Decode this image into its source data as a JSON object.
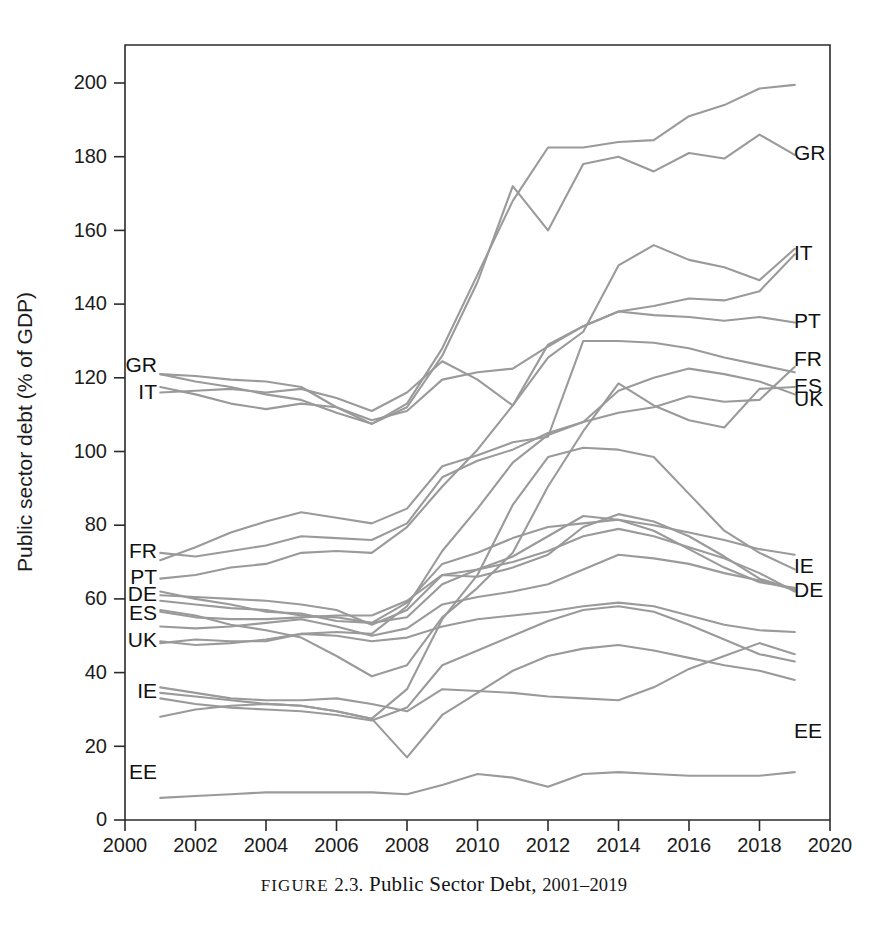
{
  "figure": {
    "caption_prefix": "FIGURE",
    "caption_number": "2.3.",
    "caption_title": "Public Sector Debt,",
    "caption_years": "2001–2019"
  },
  "axes": {
    "y_title": "Public sector debt (% of GDP)",
    "y_ticks": [
      0,
      20,
      40,
      60,
      80,
      100,
      120,
      140,
      160,
      180,
      200
    ],
    "x_ticks": [
      2000,
      2002,
      2004,
      2006,
      2008,
      2010,
      2012,
      2014,
      2016,
      2018,
      2020
    ],
    "x_min": 2000,
    "x_max": 2020,
    "y_min": 0,
    "y_max": 208,
    "line_color": "#9a9a9a",
    "axis_color": "#2b2b2b"
  },
  "chart_data": {
    "type": "line",
    "title": "Public Sector Debt, 2001–2019",
    "xlabel": "",
    "ylabel": "Public sector debt (% of GDP)",
    "xlim": [
      2000,
      2020
    ],
    "ylim": [
      0,
      208
    ],
    "grid": false,
    "legend": "inline-endpoint-labels",
    "x": [
      2001,
      2002,
      2003,
      2004,
      2005,
      2006,
      2007,
      2008,
      2009,
      2010,
      2011,
      2012,
      2013,
      2014,
      2015,
      2016,
      2017,
      2018,
      2019
    ],
    "series": [
      {
        "name": "GR",
        "label_left": "GR",
        "label_right": "GR",
        "values": [
          121.0,
          120.5,
          119.5,
          119.0,
          117.5,
          112.0,
          107.5,
          112.0,
          126.0,
          146.0,
          172.0,
          160.0,
          178.0,
          180.0,
          176.0,
          181.0,
          179.5,
          186.0,
          180.5
        ]
      },
      {
        "name": "GR-plot",
        "label_left": "",
        "label_right": "",
        "values": [
          121.0,
          119.0,
          117.5,
          115.5,
          114.0,
          110.5,
          107.5,
          113.0,
          128.0,
          148.0,
          168.0,
          182.5,
          182.5,
          184.0,
          184.5,
          191.0,
          194.0,
          198.5,
          199.5
        ]
      },
      {
        "name": "IT",
        "label_left": "IT",
        "label_right": "IT",
        "values": [
          117.5,
          115.5,
          113.0,
          111.5,
          113.0,
          112.0,
          108.5,
          111.0,
          119.5,
          121.5,
          122.5,
          128.5,
          134.0,
          138.0,
          139.5,
          141.5,
          141.0,
          143.5,
          153.5
        ]
      },
      {
        "name": "IT-b",
        "label_left": "",
        "label_right": "",
        "values": [
          116.0,
          116.5,
          117.0,
          116.0,
          117.0,
          114.5,
          111.0,
          116.0,
          124.5,
          119.5,
          112.5,
          125.5,
          132.5,
          150.5,
          156.0,
          152.0,
          150.0,
          146.5,
          155.0
        ]
      },
      {
        "name": "PT",
        "label_left": "PT",
        "label_right": "PT",
        "values": [
          65.5,
          66.5,
          68.5,
          69.5,
          72.5,
          73.0,
          72.5,
          79.5,
          90.5,
          100.5,
          112.5,
          129.0,
          134.0,
          138.0,
          137.0,
          136.5,
          135.5,
          136.5,
          135.0
        ]
      },
      {
        "name": "FR",
        "label_left": "FR",
        "label_right": "FR",
        "values": [
          72.5,
          71.5,
          73.0,
          74.5,
          77.0,
          76.5,
          76.0,
          80.5,
          93.0,
          97.5,
          100.5,
          105.0,
          108.0,
          110.5,
          112.0,
          115.0,
          113.5,
          114.0,
          123.0
        ]
      },
      {
        "name": "FR-b",
        "label_left": "",
        "label_right": "",
        "values": [
          70.5,
          74.0,
          78.0,
          81.0,
          83.5,
          82.0,
          80.5,
          84.5,
          96.0,
          99.0,
          102.5,
          104.0,
          130.0,
          130.0,
          129.5,
          128.0,
          125.5,
          123.5,
          121.5
        ]
      },
      {
        "name": "ES",
        "label_left": "ES",
        "label_right": "ES",
        "values": [
          57.0,
          55.5,
          53.0,
          51.5,
          49.5,
          44.5,
          39.0,
          42.0,
          55.0,
          63.0,
          72.5,
          90.5,
          105.5,
          118.5,
          112.5,
          108.5,
          106.5,
          117.0,
          117.5
        ]
      },
      {
        "name": "UK",
        "label_left": "UK",
        "label_right": "UK",
        "values": [
          48.0,
          49.0,
          48.5,
          48.5,
          50.5,
          51.0,
          50.5,
          58.0,
          73.0,
          84.5,
          97.0,
          104.5,
          108.0,
          116.5,
          120.0,
          122.5,
          121.0,
          119.0,
          115.5
        ]
      },
      {
        "name": "DE",
        "label_left": "DE",
        "label_right": "DE",
        "values": [
          61.0,
          60.5,
          60.0,
          59.5,
          58.5,
          57.0,
          53.0,
          57.0,
          66.5,
          66.0,
          68.5,
          72.0,
          79.5,
          83.0,
          81.0,
          77.0,
          71.5,
          65.5,
          62.5
        ]
      },
      {
        "name": "DE-b",
        "label_left": "",
        "label_right": "",
        "values": [
          59.5,
          58.5,
          57.5,
          57.0,
          55.5,
          55.0,
          53.5,
          55.0,
          64.0,
          68.0,
          71.5,
          77.0,
          82.5,
          81.5,
          78.5,
          73.5,
          68.5,
          64.5,
          63.0
        ]
      },
      {
        "name": "IE",
        "label_left": "IE",
        "label_right": "IE",
        "values": [
          34.5,
          33.5,
          32.5,
          31.5,
          31.0,
          29.5,
          27.5,
          35.5,
          54.5,
          66.5,
          85.5,
          98.5,
          101.0,
          100.5,
          98.5,
          88.5,
          78.5,
          72.5,
          68.0
        ]
      },
      {
        "name": "IE-b",
        "label_left": "",
        "label_right": "",
        "values": [
          36.0,
          34.5,
          33.0,
          32.5,
          32.5,
          33.0,
          31.5,
          29.5,
          35.5,
          35.0,
          34.5,
          33.5,
          33.0,
          32.5,
          36.0,
          41.0,
          44.5,
          48.0,
          45.0
        ]
      },
      {
        "name": "EE",
        "label_left": "EE",
        "label_right": "EE",
        "values": [
          6.0,
          6.5,
          7.0,
          7.5,
          7.5,
          7.5,
          7.5,
          7.0,
          9.5,
          12.5,
          11.5,
          9.0,
          12.5,
          13.0,
          12.5,
          12.0,
          12.0,
          12.0,
          13.0
        ]
      },
      {
        "name": "mid-a",
        "label_left": "",
        "label_right": "",
        "values": [
          62.0,
          60.0,
          58.5,
          56.5,
          56.0,
          54.0,
          53.5,
          59.0,
          69.5,
          72.5,
          76.5,
          79.5,
          80.5,
          81.5,
          80.0,
          78.0,
          76.0,
          73.5,
          72.0
        ]
      },
      {
        "name": "mid-b",
        "label_left": "",
        "label_right": "",
        "values": [
          56.5,
          55.0,
          54.5,
          54.5,
          55.0,
          55.5,
          55.5,
          59.5,
          66.5,
          68.0,
          70.0,
          73.0,
          77.0,
          79.0,
          77.0,
          74.0,
          71.0,
          67.0,
          62.0
        ]
      },
      {
        "name": "mid-c",
        "label_left": "",
        "label_right": "",
        "values": [
          48.5,
          47.5,
          48.0,
          49.0,
          50.5,
          50.0,
          48.5,
          49.5,
          52.5,
          54.5,
          55.5,
          56.5,
          58.0,
          59.0,
          58.0,
          55.5,
          53.0,
          51.5,
          51.0
        ]
      },
      {
        "name": "mid-d",
        "label_left": "",
        "label_right": "",
        "values": [
          52.5,
          52.0,
          52.5,
          53.5,
          54.5,
          52.5,
          50.0,
          52.0,
          58.5,
          60.5,
          62.0,
          64.0,
          68.0,
          72.0,
          71.0,
          69.5,
          67.0,
          65.0,
          62.5
        ]
      },
      {
        "name": "mid-e",
        "label_left": "",
        "label_right": "",
        "values": [
          28.0,
          30.0,
          31.0,
          31.5,
          31.0,
          29.5,
          27.5,
          17.0,
          28.5,
          34.5,
          40.5,
          44.5,
          46.5,
          47.5,
          46.0,
          44.0,
          42.0,
          40.5,
          38.0
        ]
      },
      {
        "name": "mid-f",
        "label_left": "",
        "label_right": "",
        "values": [
          33.0,
          31.5,
          30.5,
          30.0,
          29.5,
          28.5,
          27.0,
          30.5,
          42.0,
          46.0,
          50.0,
          54.0,
          57.0,
          58.0,
          56.5,
          53.0,
          49.0,
          45.0,
          43.0
        ]
      }
    ]
  }
}
